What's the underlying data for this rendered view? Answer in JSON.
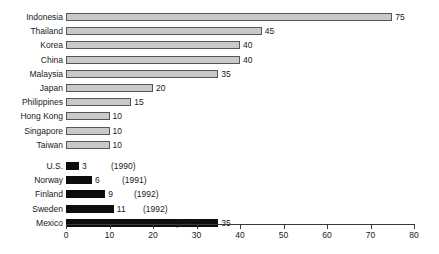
{
  "chart_data": {
    "type": "bar",
    "orientation": "horizontal",
    "title": "",
    "xlabel": "",
    "ylabel": "",
    "xlim": [
      0,
      80
    ],
    "xticks": [
      0,
      10,
      20,
      30,
      40,
      50,
      60,
      70,
      80
    ],
    "grid": false,
    "legend": null,
    "groups": [
      {
        "name": "asia",
        "style": "gray",
        "categories": [
          "Indonesia",
          "Thailand",
          "Korea",
          "China",
          "Malaysia",
          "Japan",
          "Philippines",
          "Hong Kong",
          "Singapore",
          "Taiwan"
        ],
        "values": [
          75,
          45,
          40,
          40,
          35,
          20,
          15,
          10,
          10,
          10
        ],
        "labels": [
          "75",
          "45",
          "40",
          "40",
          "35",
          "20",
          "15",
          "10",
          "10",
          "10"
        ],
        "annotations": [
          "",
          "",
          "",
          "",
          "",
          "",
          "",
          "",
          "",
          ""
        ]
      },
      {
        "name": "other",
        "style": "black",
        "categories": [
          "U.S.",
          "Norway",
          "Finland",
          "Sweden",
          "Mexico"
        ],
        "values": [
          3,
          6,
          9,
          11,
          35
        ],
        "labels": [
          "3",
          "6",
          "9",
          "11",
          "35"
        ],
        "annotations": [
          "(1990)",
          "(1991)",
          "(1992)",
          "(1992)",
          "(1997)"
        ]
      }
    ],
    "colors": {
      "gray_bar_fill": "#c9c9c9",
      "gray_bar_edge": "#555555",
      "black_bar_fill": "#0d0d0d",
      "axis": "#3a3a3a",
      "text": "#1a1a1a",
      "background": "#ffffff"
    }
  }
}
